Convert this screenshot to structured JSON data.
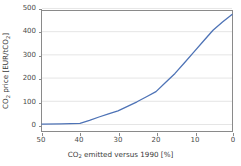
{
  "figure": {
    "background": "#ffffff",
    "axes_border_color": "#8a8a8a",
    "grid_color": "#d9d9d9",
    "line_color": "#4e73b6"
  },
  "axis": {
    "x_label_text": "CO2 emitted versus 1990 [%]",
    "y_label_text": "CO2 price [EUR/tCO2]",
    "x_ticks": [
      "50",
      "40",
      "30",
      "20",
      "10",
      "0"
    ],
    "y_ticks": [
      "0",
      "100",
      "200",
      "300",
      "400",
      "500"
    ]
  },
  "chart_data": {
    "type": "line",
    "title": "",
    "subtitle": "",
    "xlabel": "CO2 emitted versus 1990 [%]",
    "ylabel": "CO2 price [EUR/tCO2]",
    "xlim": [
      50,
      0
    ],
    "ylim": [
      0,
      500
    ],
    "x_inverted": true,
    "grid": "horizontal",
    "legend": "none",
    "x_tick_values": [
      50,
      40,
      30,
      20,
      10,
      0
    ],
    "y_tick_values": [
      0,
      100,
      200,
      300,
      400,
      500
    ],
    "series": [
      {
        "name": "CO2 price",
        "color": "#4e73b6",
        "x": [
          50,
          45,
          40,
          37.5,
          35,
          32.5,
          30,
          27.5,
          25,
          22.5,
          20,
          17.5,
          15,
          12.5,
          10,
          7.5,
          5,
          2.5,
          0
        ],
        "values": [
          2,
          3,
          5,
          18,
          33,
          47,
          60,
          80,
          100,
          122,
          145,
          185,
          225,
          272,
          320,
          368,
          415,
          452,
          485
        ]
      }
    ],
    "annotations": []
  }
}
